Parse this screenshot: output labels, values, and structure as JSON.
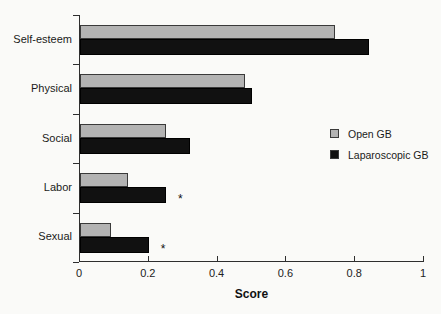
{
  "figure": {
    "background": "#fafaf8"
  },
  "chart_data": {
    "type": "bar",
    "orientation": "horizontal",
    "title": "",
    "xlabel": "Score",
    "ylabel": "",
    "xlim": [
      0,
      1
    ],
    "xticks": [
      0,
      0.2,
      0.4,
      0.6,
      0.8,
      1
    ],
    "xtick_labels": [
      "0",
      "0.2",
      "0.4",
      "0.6",
      "0.8",
      "1"
    ],
    "grid": false,
    "legend_position": "right-middle",
    "categories": [
      "Self-esteem",
      "Physical",
      "Social",
      "Labor",
      "Sexual"
    ],
    "series": [
      {
        "name": "Open GB",
        "color": "#b3b3b3",
        "values": [
          0.74,
          0.48,
          0.25,
          0.14,
          0.09
        ]
      },
      {
        "name": "Laparoscopic GB",
        "color": "#111111",
        "values": [
          0.84,
          0.5,
          0.32,
          0.25,
          0.2
        ]
      }
    ],
    "annotations": [
      {
        "category": "Labor",
        "series": "Laparoscopic GB",
        "text": "*"
      },
      {
        "category": "Sexual",
        "series": "Laparoscopic GB",
        "text": "*"
      }
    ]
  }
}
